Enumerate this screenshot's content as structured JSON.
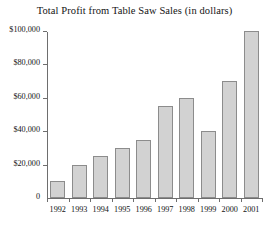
{
  "chart_data": {
    "type": "bar",
    "title": "Total Profit from Table Saw Sales (in dollars)",
    "xlabel": "",
    "ylabel": "",
    "categories": [
      "1992",
      "1993",
      "1994",
      "1995",
      "1996",
      "1997",
      "1998",
      "1999",
      "2000",
      "2001"
    ],
    "values": [
      10000,
      20000,
      25000,
      30000,
      35000,
      55000,
      60000,
      40000,
      70000,
      100000
    ],
    "ylim": [
      0,
      100000
    ],
    "ytick_values": [
      0,
      20000,
      40000,
      60000,
      80000,
      100000
    ],
    "ytick_labels": [
      "0",
      "$20,000",
      "$40,000",
      "$60,000",
      "$80,000",
      "$100,000"
    ],
    "grid": false,
    "legend": null,
    "bar_fill_color": "#d2d2d2",
    "bar_border_color": "#8c8c8c",
    "axis_color": "#6e6e6e",
    "background_color": "#ffffff"
  }
}
